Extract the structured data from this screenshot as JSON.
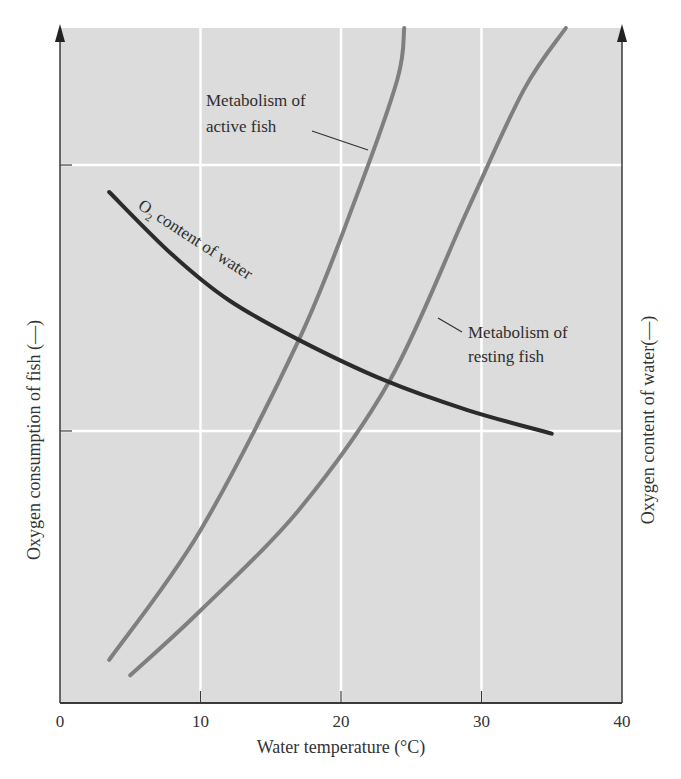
{
  "chart_data": {
    "type": "line",
    "title": "",
    "xlabel": "Water temperature (°C)",
    "ylabel_left": "Oxygen consumption of fish (—)",
    "ylabel_right": "Oxygen content of water(—)",
    "xlim": [
      0,
      40
    ],
    "ylim": [
      0,
      100
    ],
    "y_units": "relative (no numeric ticks shown)",
    "x_ticks": [
      0,
      10,
      20,
      30,
      40
    ],
    "x_tick_labels": [
      "0",
      "10",
      "20",
      "30",
      "40"
    ],
    "y_gridlines_relative": [
      40.3,
      79.7
    ],
    "grid": true,
    "legend": "none (curves labelled directly)",
    "series": [
      {
        "name": "Metabolism of active fish",
        "axis": "left",
        "color": "#7f7f7f",
        "x": [
          3.5,
          10,
          17,
          21,
          24,
          24.5
        ],
        "y": [
          6.4,
          25.6,
          53.8,
          74.5,
          92.3,
          100
        ]
      },
      {
        "name": "Metabolism of resting fish",
        "axis": "left",
        "color": "#7f7f7f",
        "x": [
          5,
          10,
          17,
          23.5,
          29,
          33,
          36
        ],
        "y": [
          4.1,
          13.7,
          28.6,
          47.9,
          73.0,
          90.8,
          100
        ]
      },
      {
        "name": "O2 content of water",
        "axis": "right",
        "color": "#2b2b2b",
        "x": [
          3.5,
          8,
          12,
          17,
          23,
          29,
          35
        ],
        "y": [
          75.7,
          66.4,
          59.7,
          53.8,
          47.9,
          43.4,
          39.9
        ]
      }
    ],
    "annotations": [
      {
        "text_line1": "Metabolism of",
        "text_line2": "active fish"
      },
      {
        "text_main": "content of water",
        "text_prefix": "O",
        "text_sub": "2"
      },
      {
        "text_line1": "Metabolism of",
        "text_line2": "resting fish"
      }
    ]
  },
  "colors": {
    "plot_background": "#dcdcdc",
    "gridline": "#ffffff",
    "axis": "#3a3a3a",
    "fish_curves": "#7f7f7f",
    "water_curve": "#2b2b2b"
  }
}
